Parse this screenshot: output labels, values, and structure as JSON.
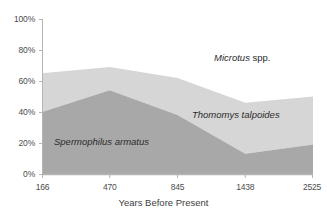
{
  "chart_data": {
    "type": "area",
    "stacked": true,
    "title": "",
    "subtitle": "",
    "xlabel": "Years Before Present",
    "ylabel": "",
    "x": [
      166,
      470,
      845,
      1438,
      2525
    ],
    "categories": [
      "166",
      "470",
      "845",
      "1438",
      "2525"
    ],
    "xtick_labels": [
      "166",
      "470",
      "845",
      "1438",
      "2525"
    ],
    "ytick_labels": [
      "0%",
      "20%",
      "40%",
      "60%",
      "80%",
      "100%"
    ],
    "ytick_values": [
      0,
      20,
      40,
      60,
      80,
      100
    ],
    "ylim": [
      0,
      100
    ],
    "grid": false,
    "legend_position": "inline-annotations",
    "series": [
      {
        "name": "Spermophilus armatus",
        "name_italic": "Spermophilus armatus",
        "color": "#a8a8a8",
        "values": [
          40,
          54,
          38,
          13,
          19
        ]
      },
      {
        "name": "Thomomys talpoides",
        "name_italic": "Thomomys talpoides",
        "color": "#d6d6d6",
        "values": [
          25,
          15,
          24,
          33,
          31
        ]
      },
      {
        "name": "Microtus spp.",
        "name_italic": "Microtus",
        "name_upright": " spp.",
        "color": "#ffffff",
        "values": [
          35,
          31,
          38,
          54,
          50
        ]
      }
    ],
    "cumulative_tops": {
      "spermophilus_armatus": [
        40,
        54,
        38,
        13,
        19
      ],
      "thomomys_talpoides": [
        65,
        69,
        62,
        46,
        50
      ],
      "microtus_spp": [
        100,
        100,
        100,
        100,
        100
      ]
    },
    "annotations": [
      {
        "text": "Microtus spp.",
        "series": "Microtus spp."
      },
      {
        "text": "Thomomys talpoides",
        "series": "Thomomys talpoides"
      },
      {
        "text": "Spermophilus armatus",
        "series": "Spermophilus armatus"
      }
    ]
  },
  "axis": {
    "x_title": "Years Before Present",
    "y_ticks": [
      "100%",
      "80%",
      "60%",
      "40%",
      "20%",
      "0%"
    ],
    "x_ticks": [
      "166",
      "470",
      "845",
      "1438",
      "2525"
    ]
  },
  "labels": {
    "microtus_italic": "Microtus",
    "microtus_upright": " spp.",
    "thomomys": "Thomomys talpoides",
    "spermophilus": "Spermophilus armatus"
  },
  "colors": {
    "band_bottom": "#a8a8a8",
    "band_middle": "#d6d6d6",
    "band_top": "#ffffff",
    "axis_line": "#b0b0b0",
    "tick_text": "#4d4d4d"
  }
}
